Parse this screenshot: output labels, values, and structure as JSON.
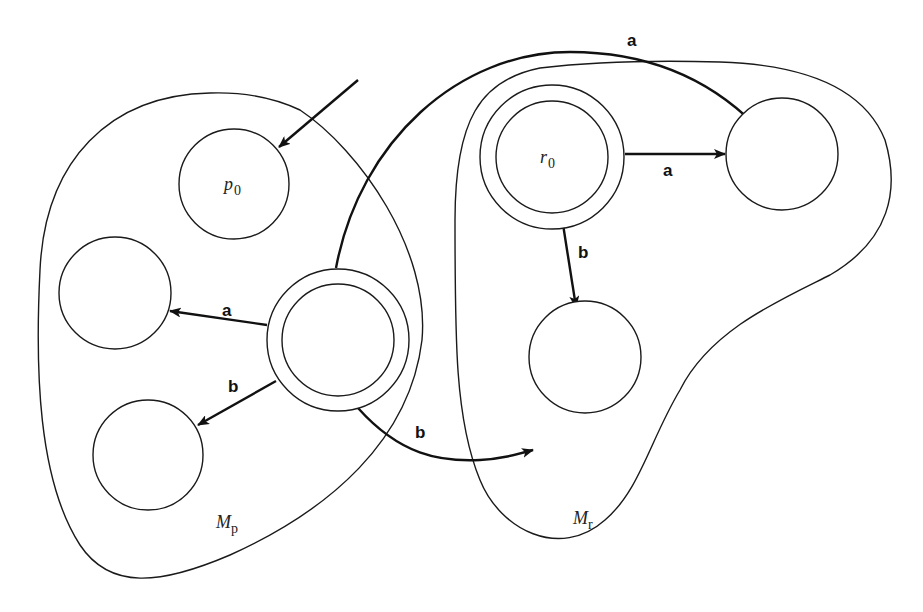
{
  "diagram": {
    "type": "finite-automaton-composition",
    "regions": [
      {
        "id": "Mp",
        "label_main": "M",
        "label_sub": "p"
      },
      {
        "id": "Mr",
        "label_main": "M",
        "label_sub": "r"
      }
    ],
    "states": [
      {
        "id": "p0",
        "label_main": "p",
        "label_sub": "0",
        "region": "Mp",
        "start": true,
        "accepting": false
      },
      {
        "id": "p_left",
        "label_main": "",
        "label_sub": "",
        "region": "Mp",
        "accepting": false
      },
      {
        "id": "p_bottom",
        "label_main": "",
        "label_sub": "",
        "region": "Mp",
        "accepting": false
      },
      {
        "id": "p_final",
        "label_main": "",
        "label_sub": "",
        "region": "Mp",
        "accepting": true
      },
      {
        "id": "r0",
        "label_main": "r",
        "label_sub": "0",
        "region": "Mr",
        "accepting": true
      },
      {
        "id": "r_right",
        "label_main": "",
        "label_sub": "",
        "region": "Mr",
        "accepting": false
      },
      {
        "id": "r_bottom",
        "label_main": "",
        "label_sub": "",
        "region": "Mr",
        "accepting": false
      }
    ],
    "edges": [
      {
        "from": "p_final",
        "to": "p_left",
        "label": "a"
      },
      {
        "from": "p_final",
        "to": "p_bottom",
        "label": "b"
      },
      {
        "from": "p_final",
        "to": "r_right",
        "label": "a"
      },
      {
        "from": "p_final",
        "to": "r_bottom",
        "label": "b"
      },
      {
        "from": "r0",
        "to": "r_right",
        "label": "a"
      },
      {
        "from": "r0",
        "to": "r_bottom",
        "label": "b"
      }
    ]
  }
}
